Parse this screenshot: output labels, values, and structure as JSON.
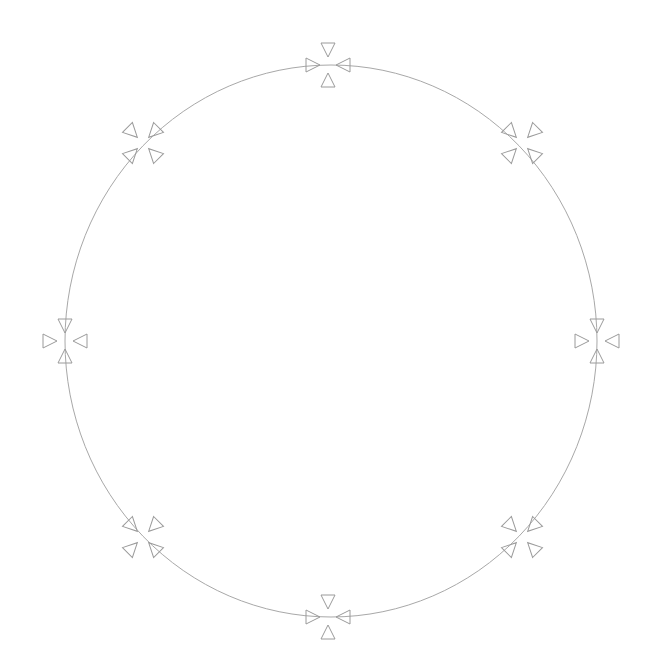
{
  "diagram": {
    "type": "circle-with-markers",
    "center": {
      "x": 331,
      "y": 341
    },
    "radius_x": 266,
    "radius_y": 276,
    "stroke_color": "#a8a8a8",
    "marker_color": "#9a9a9a",
    "marker_style": "four inward-pointing triangles",
    "markers": [
      {
        "name": "top",
        "x": 328,
        "y": 65,
        "angle": 0
      },
      {
        "name": "top-right",
        "x": 522,
        "y": 143,
        "angle": 45
      },
      {
        "name": "right",
        "x": 597,
        "y": 341,
        "angle": 0
      },
      {
        "name": "bottom-right",
        "x": 522,
        "y": 537,
        "angle": -45
      },
      {
        "name": "bottom",
        "x": 328,
        "y": 617,
        "angle": 0
      },
      {
        "name": "bottom-left",
        "x": 143,
        "y": 537,
        "angle": 45
      },
      {
        "name": "left",
        "x": 65,
        "y": 341,
        "angle": 0
      },
      {
        "name": "top-left",
        "x": 143,
        "y": 143,
        "angle": -45
      }
    ]
  }
}
